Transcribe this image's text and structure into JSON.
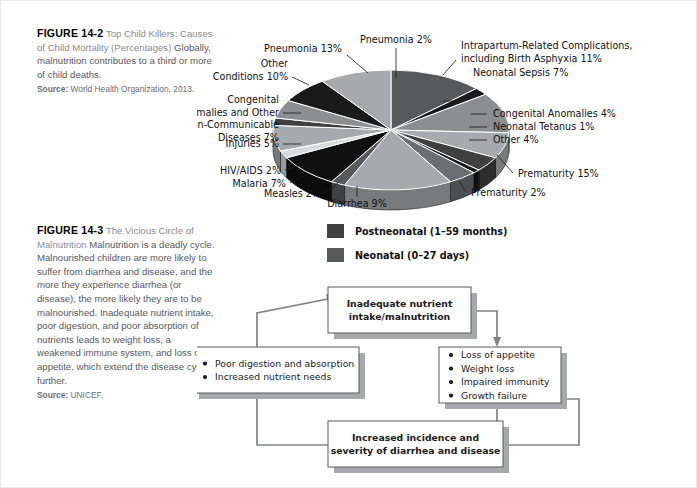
{
  "figure_14_2": {
    "number": "FIGURE 14-2",
    "title": "Top Child Killers: Causes of Child Mortality (Percentages)",
    "body": "Globally, malnutrition contributes to a third or more of child deaths.",
    "source_label": "Source:",
    "source_text": "World Health Organization, 2013."
  },
  "figure_14_3": {
    "number": "FIGURE 14-3",
    "title": "The Vicious Circle of Malnutrition",
    "body": "Malnutrition is a deadly cycle. Malnourished children are more likely to suffer from diarrhea and disease, and the more they experience diarrhea (or disease), the more likely they are to be malnourished. Inadequate nutrient intake, poor digestion, and poor absorption of nutrients leads to weight loss, a weakened immune system, and loss of appetite, which extend the disease cycle further.",
    "source_label": "Source:",
    "source_text": "UNICEF."
  },
  "chart_data": {
    "type": "pie",
    "title": "Top Child Killers: Causes of Child Mortality (Percentages)",
    "legend_position": "bottom",
    "grid": false,
    "categories": [
      "Pneumonia 13%",
      "Pneumonia 2%",
      "Intrapartum-Related Complications, including Birth Asphyxia 11%",
      "Neonatal Sepsis 7%",
      "Congenital Anomalies 4%",
      "Neonatal Tetanus 1%",
      "Other 4%",
      "Prematurity 15%",
      "Prematurity 2%",
      "Diarrhea 9%",
      "Measles 2%",
      "Malaria 7%",
      "HIV/AIDS 2%",
      "Injuries 5%",
      "Congenital Anomalies and Other Non-Communicable Diseases 7%",
      "Other Conditions 10%"
    ],
    "values": [
      13,
      2,
      11,
      7,
      4,
      1,
      4,
      15,
      2,
      9,
      2,
      7,
      2,
      5,
      7,
      10
    ],
    "labels": [
      {
        "id": "pneumonia-13",
        "text": "Pneumonia 13%",
        "value": 13,
        "group": "Postneonatal"
      },
      {
        "id": "pneumonia-2",
        "text": "Pneumonia 2%",
        "value": 2,
        "group": "Neonatal"
      },
      {
        "id": "intrapartum",
        "line1": "Intrapartum-Related Complications,",
        "line2": "including Birth Asphyxia 11%",
        "text": "Intrapartum-Related Complications, including Birth Asphyxia 11%",
        "value": 11,
        "group": "Neonatal"
      },
      {
        "id": "neonatal-sepsis",
        "text": "Neonatal Sepsis 7%",
        "value": 7,
        "group": "Neonatal"
      },
      {
        "id": "congenital-anomalies",
        "text": "Congenital Anomalies 4%",
        "value": 4,
        "group": "Neonatal"
      },
      {
        "id": "neonatal-tetanus",
        "text": "Neonatal Tetanus 1%",
        "value": 1,
        "group": "Neonatal"
      },
      {
        "id": "other-4",
        "text": "Other 4%",
        "value": 4,
        "group": "Neonatal"
      },
      {
        "id": "prematurity-15",
        "text": "Prematurity 15%",
        "value": 15,
        "group": "Neonatal"
      },
      {
        "id": "prematurity-2",
        "text": "Prematurity 2%",
        "value": 2,
        "group": "Postneonatal"
      },
      {
        "id": "diarrhea-9",
        "text": "Diarrhea 9%",
        "value": 9,
        "group": "Postneonatal"
      },
      {
        "id": "measles-2",
        "text": "Measles 2%",
        "value": 2,
        "group": "Postneonatal"
      },
      {
        "id": "malaria-7",
        "text": "Malaria 7%",
        "value": 7,
        "group": "Postneonatal"
      },
      {
        "id": "hivaids-2",
        "text": "HIV/AIDS 2%",
        "value": 2,
        "group": "Postneonatal"
      },
      {
        "id": "injuries-5",
        "text": "Injuries 5%",
        "value": 5,
        "group": "Postneonatal"
      },
      {
        "id": "congenital-ncd",
        "line1": "Congenital",
        "line2": "Anomalies and Other",
        "line3": "Non-Communicable",
        "line4": "Diseases 7%",
        "text": "Congenital Anomalies and Other Non-Communicable Diseases 7%",
        "value": 7,
        "group": "Postneonatal"
      },
      {
        "id": "other-conditions",
        "line1": "Other",
        "line2": "Conditions 10%",
        "text": "Other Conditions 10%",
        "value": 10,
        "group": "Postneonatal"
      }
    ],
    "legend": [
      {
        "id": "postneonatal",
        "label": "Postneonatal (1–59 months)",
        "color": "#404041"
      },
      {
        "id": "neonatal",
        "label": "Neonatal (0–27 days)",
        "color": "#58595b"
      }
    ]
  },
  "cycle_diagram": {
    "boxes": [
      {
        "id": "inadequate-nutrient",
        "lines": [
          "Inadequate nutrient",
          "intake/malnutrition"
        ],
        "bold": true
      },
      {
        "id": "symptoms",
        "lines": [
          "Loss of appetite",
          "Weight loss",
          "Impaired immunity",
          "Growth failure"
        ],
        "bullets": true,
        "bold": false
      },
      {
        "id": "increased-incidence",
        "lines": [
          "Increased incidence and",
          "severity of diarrhea and disease"
        ],
        "bold": true
      },
      {
        "id": "poor-digestion",
        "lines": [
          "Poor digestion and absorption",
          "Increased nutrient needs"
        ],
        "bullets": true,
        "bold": false
      }
    ]
  },
  "colors": {
    "page_background": "#ffffff",
    "caption_text": "#58595b",
    "caption_heading": "#000000",
    "pie_dark": "#1a1a1a",
    "pie_mid": "#58595b",
    "pie_light": "#a7a9ac",
    "pie_pale": "#d9dadb",
    "box_stroke": "#58595b",
    "box_shadow": "#a7a9ac",
    "arrow": "#808285"
  }
}
